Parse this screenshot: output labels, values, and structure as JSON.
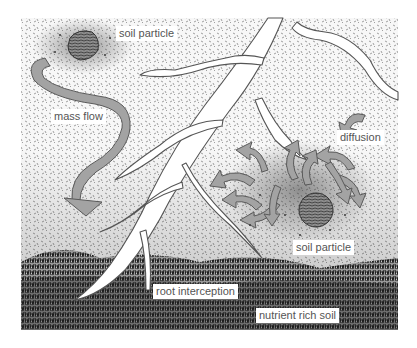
{
  "diagram": {
    "colors": {
      "background": "#ffffff",
      "soil_stipple": "#6a6a6a",
      "rich_soil": "#2a2a2a",
      "arrow_fill": "#a3a3a3",
      "arrow_stroke": "#5a5a5a",
      "root_fill": "#ffffff",
      "root_stroke": "#555555",
      "particle_fill": "#8a8a8a",
      "label_text": "#555555"
    },
    "labels": {
      "soil_particle_top": "soil particle",
      "mass_flow": "mass flow",
      "diffusion": "diffusion",
      "soil_particle_bottom": "soil particle",
      "root_interception": "root interception",
      "nutrient_rich_soil": "nutrient rich soil"
    },
    "elements": {
      "soil_particles": [
        {
          "name": "soil particle (top-left)",
          "x": 83,
          "y": 44,
          "r": 15
        },
        {
          "name": "soil particle (bottom-right)",
          "x": 315,
          "y": 210,
          "r": 17
        }
      ],
      "mass_flow_arrow": {
        "from": "top-left soil particle",
        "to": "root"
      },
      "diffusion_arrows": 11,
      "roots": "branching white root system growing down from top-center"
    }
  }
}
